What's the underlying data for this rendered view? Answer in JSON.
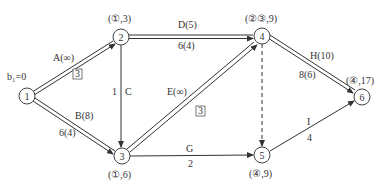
{
  "diagram": {
    "type": "network-flow",
    "start_label": "b₁=0",
    "nodes": [
      {
        "id": "1",
        "label": "1",
        "x": 27,
        "y": 96,
        "mark": ""
      },
      {
        "id": "2",
        "label": "2",
        "x": 121,
        "y": 37,
        "mark": "(①,3)"
      },
      {
        "id": "3",
        "label": "3",
        "x": 122,
        "y": 156,
        "mark": "(①,6)"
      },
      {
        "id": "4",
        "label": "4",
        "x": 262,
        "y": 36,
        "mark": "(②③,9)"
      },
      {
        "id": "5",
        "label": "5",
        "x": 262,
        "y": 155,
        "mark": "(④,9)"
      },
      {
        "id": "6",
        "label": "6",
        "x": 362,
        "y": 97,
        "mark": "(④,17)"
      }
    ],
    "edges": [
      {
        "from": "1",
        "to": "2",
        "name": "A(∞)",
        "value": "3",
        "value_boxed": true,
        "style": "double"
      },
      {
        "from": "1",
        "to": "3",
        "name": "B(8)",
        "value": "6(4)",
        "value_boxed": false,
        "style": "double"
      },
      {
        "from": "2",
        "to": "3",
        "name": "C",
        "value": "1",
        "value_boxed": false,
        "style": "single"
      },
      {
        "from": "2",
        "to": "4",
        "name": "D(5)",
        "value": "6(4)",
        "value_boxed": false,
        "style": "double"
      },
      {
        "from": "3",
        "to": "4",
        "name": "E(∞)",
        "value": "3",
        "value_boxed": true,
        "style": "double"
      },
      {
        "from": "3",
        "to": "5",
        "name": "G",
        "value": "2",
        "value_boxed": false,
        "style": "single"
      },
      {
        "from": "4",
        "to": "5",
        "name": "",
        "value": "",
        "value_boxed": false,
        "style": "dashed"
      },
      {
        "from": "4",
        "to": "6",
        "name": "H(10)",
        "value": "8(6)",
        "value_boxed": false,
        "style": "double"
      },
      {
        "from": "5",
        "to": "6",
        "name": "I",
        "value": "4",
        "value_boxed": false,
        "style": "single"
      }
    ]
  }
}
